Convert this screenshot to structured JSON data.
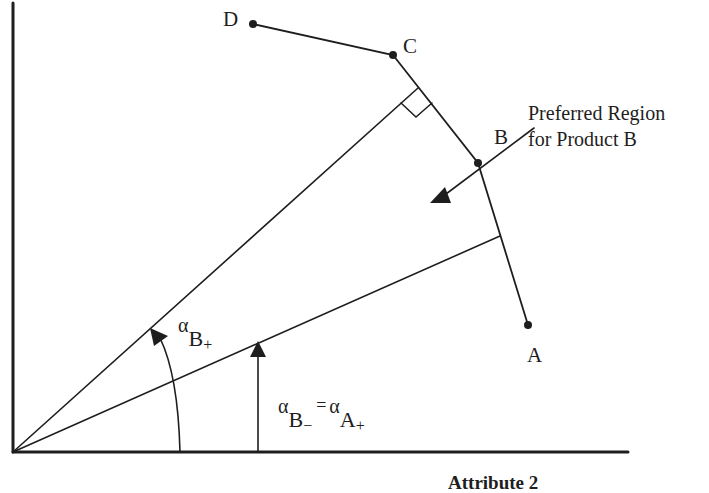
{
  "diagram": {
    "points": [
      {
        "id": "D",
        "label": "D",
        "x": 253,
        "y": 24
      },
      {
        "id": "C",
        "label": "C",
        "x": 393,
        "y": 55
      },
      {
        "id": "B",
        "label": "B",
        "x": 478,
        "y": 163
      },
      {
        "id": "A",
        "label": "A",
        "x": 528,
        "y": 325
      }
    ],
    "callout": {
      "line1": "Preferred Region",
      "line2": "for Product B"
    },
    "angle_upper": {
      "symbol": "α",
      "subscript": "B",
      "superscript": "+"
    },
    "angle_lower": {
      "symbol": "α",
      "subscript": "B",
      "superscript": "−",
      "equals": "=",
      "symbol2": "α",
      "subscript2": "A",
      "superscript2": "+"
    },
    "x_axis_title": "Attribute 2",
    "colors": {
      "ink": "#1e1e1e",
      "background": "#ffffff"
    }
  }
}
